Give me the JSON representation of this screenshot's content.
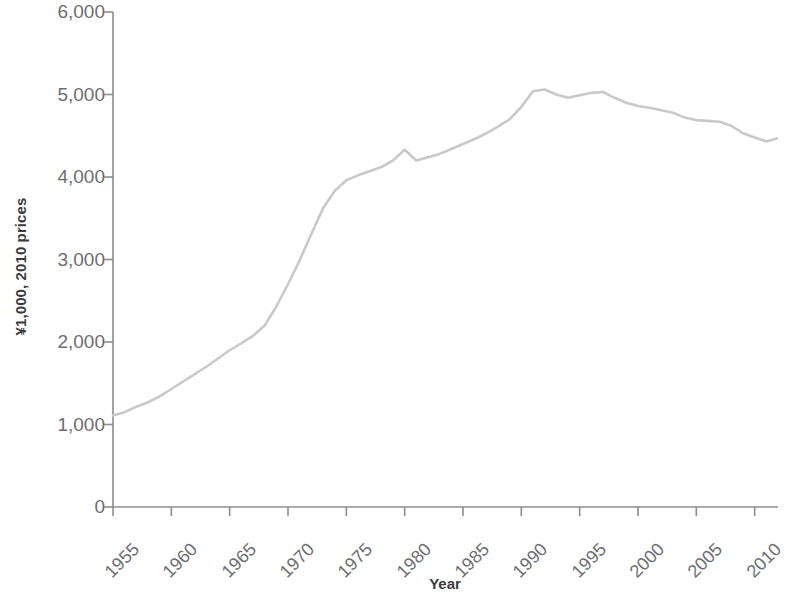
{
  "chart_data": {
    "type": "line",
    "title": "",
    "subtitle": "",
    "xlabel": "Year",
    "ylabel": "¥1,000, 2010 prices",
    "xlim": [
      1955,
      2012
    ],
    "ylim": [
      0,
      6000
    ],
    "grid": false,
    "legend": null,
    "legend_position": "none",
    "line_color": "#c9c9c9",
    "axis_color": "#8c8c8e",
    "x_ticks": [
      "1955",
      "1960",
      "1965",
      "1970",
      "1975",
      "1980",
      "1985",
      "1990",
      "1995",
      "2000",
      "2005",
      "2010"
    ],
    "x_tick_values": [
      1955,
      1960,
      1965,
      1970,
      1975,
      1980,
      1985,
      1990,
      1995,
      2000,
      2005,
      2010
    ],
    "y_ticks": [
      "0",
      "1,000",
      "2,000",
      "3,000",
      "4,000",
      "5,000",
      "6,000"
    ],
    "y_tick_values": [
      0,
      1000,
      2000,
      3000,
      4000,
      5000,
      6000
    ],
    "series": [
      {
        "name": "Value added per worker",
        "x": [
          1955,
          1956,
          1957,
          1958,
          1959,
          1960,
          1961,
          1962,
          1963,
          1964,
          1965,
          1966,
          1967,
          1968,
          1969,
          1970,
          1971,
          1972,
          1973,
          1974,
          1975,
          1976,
          1977,
          1978,
          1979,
          1980,
          1981,
          1982,
          1983,
          1984,
          1985,
          1986,
          1987,
          1988,
          1989,
          1990,
          1991,
          1992,
          1993,
          1994,
          1995,
          1996,
          1997,
          1998,
          1999,
          2000,
          2001,
          2002,
          2003,
          2004,
          2005,
          2006,
          2007,
          2008,
          2009,
          2010,
          2011,
          2012
        ],
        "values": [
          1110,
          1150,
          1215,
          1270,
          1340,
          1430,
          1520,
          1610,
          1700,
          1800,
          1900,
          1985,
          2075,
          2200,
          2430,
          2700,
          2990,
          3310,
          3620,
          3830,
          3960,
          4020,
          4070,
          4120,
          4200,
          4330,
          4200,
          4240,
          4280,
          4340,
          4400,
          4460,
          4530,
          4610,
          4700,
          4850,
          5040,
          5060,
          5000,
          4960,
          4990,
          5020,
          5030,
          4960,
          4900,
          4860,
          4840,
          4810,
          4780,
          4720,
          4690,
          4680,
          4670,
          4620,
          4530,
          4480,
          4430,
          4470
        ]
      }
    ]
  },
  "axes": {
    "y_axis_title": "¥1,000, 2010 prices",
    "x_axis_title": "Year"
  }
}
